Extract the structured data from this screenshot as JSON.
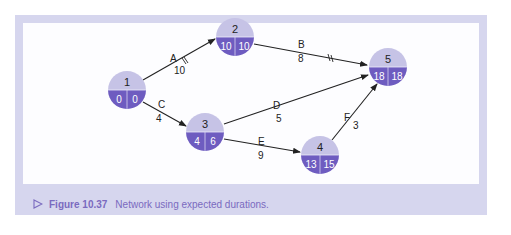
{
  "caption": {
    "figure_label": "Figure 10.37",
    "text": "Network using expected durations."
  },
  "colors": {
    "frame": "#d6d6ee",
    "node_top": "#c6c3e6",
    "node_bottom": "#6e5cc0",
    "caption_text": "#7a6abf",
    "arrow": "#222222"
  },
  "nodes": [
    {
      "id": "1",
      "earliest": "0",
      "latest": "0"
    },
    {
      "id": "2",
      "earliest": "10",
      "latest": "10"
    },
    {
      "id": "3",
      "earliest": "4",
      "latest": "6"
    },
    {
      "id": "4",
      "earliest": "13",
      "latest": "15"
    },
    {
      "id": "5",
      "earliest": "18",
      "latest": "18"
    }
  ],
  "activities": [
    {
      "name": "A",
      "duration": "10",
      "from": "1",
      "to": "2",
      "critical": true
    },
    {
      "name": "B",
      "duration": "8",
      "from": "2",
      "to": "5",
      "critical": true
    },
    {
      "name": "C",
      "duration": "4",
      "from": "1",
      "to": "3",
      "critical": false
    },
    {
      "name": "D",
      "duration": "5",
      "from": "3",
      "to": "5",
      "critical": false
    },
    {
      "name": "E",
      "duration": "9",
      "from": "3",
      "to": "4",
      "critical": false
    },
    {
      "name": "F",
      "duration": "3",
      "from": "4",
      "to": "5",
      "critical": false
    }
  ]
}
